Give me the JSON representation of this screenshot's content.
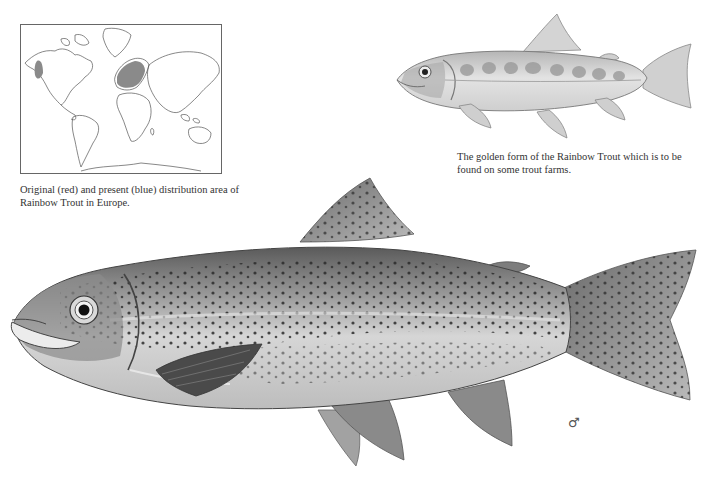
{
  "map": {
    "label": "World distribution map",
    "legend_note": "Shaded areas: North American west coast (original range) and Europe (present range)"
  },
  "captions": {
    "map": "Original (red) and present (blue) distribution area of Rainbow Trout in Europe.",
    "golden": "The golden form of the Rainbow Trout which is to be found on some trout farms."
  },
  "illustrations": {
    "golden_trout": "golden-form-rainbow-trout",
    "rainbow_trout": "rainbow-trout-male"
  },
  "symbols": {
    "sex": "♂"
  },
  "colors": {
    "background": "#ffffff",
    "outline": "#555555",
    "shading": "#8a8a8a",
    "spots": "#2b2b2b",
    "body_light": "#d8d8d8",
    "body_dark": "#7a7a7a"
  }
}
